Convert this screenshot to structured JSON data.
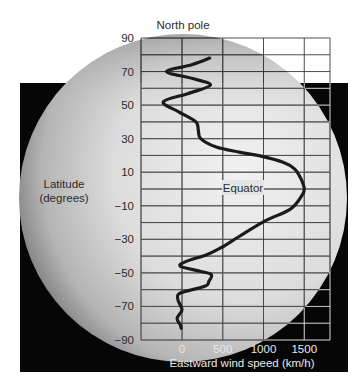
{
  "chart_data": {
    "type": "line",
    "title": "North pole",
    "xlabel": "Eastward wind speed (km/h)",
    "ylabel": "Latitude\n(degrees)",
    "annotation": "Equator",
    "xlim": [
      -200,
      1800
    ],
    "ylim": [
      -90,
      90
    ],
    "xticks": [
      0,
      500,
      1000,
      1500
    ],
    "yticks": [
      90,
      70,
      50,
      30,
      10,
      -10,
      -30,
      -50,
      -70,
      -90
    ],
    "grid": true,
    "legend": null,
    "series": [
      {
        "name": "Eastward wind speed profile",
        "points": [
          {
            "lat": 78,
            "speed": 340
          },
          {
            "lat": 74,
            "speed": 120
          },
          {
            "lat": 70,
            "speed": -190
          },
          {
            "lat": 66,
            "speed": 120
          },
          {
            "lat": 62,
            "speed": 350
          },
          {
            "lat": 57,
            "speed": 80
          },
          {
            "lat": 52,
            "speed": -230
          },
          {
            "lat": 46,
            "speed": -40
          },
          {
            "lat": 40,
            "speed": 170
          },
          {
            "lat": 35,
            "speed": 200
          },
          {
            "lat": 30,
            "speed": 230
          },
          {
            "lat": 25,
            "speed": 420
          },
          {
            "lat": 22,
            "speed": 700
          },
          {
            "lat": 20,
            "speed": 930
          },
          {
            "lat": 16,
            "speed": 1240
          },
          {
            "lat": 12,
            "speed": 1380
          },
          {
            "lat": 6,
            "speed": 1460
          },
          {
            "lat": 0,
            "speed": 1500
          },
          {
            "lat": -4,
            "speed": 1470
          },
          {
            "lat": -12,
            "speed": 1330
          },
          {
            "lat": -19,
            "speed": 1020
          },
          {
            "lat": -28,
            "speed": 710
          },
          {
            "lat": -35,
            "speed": 480
          },
          {
            "lat": -39,
            "speed": 310
          },
          {
            "lat": -43,
            "speed": 60
          },
          {
            "lat": -46,
            "speed": -20
          },
          {
            "lat": -49,
            "speed": 220
          },
          {
            "lat": -51,
            "speed": 360
          },
          {
            "lat": -55,
            "speed": 330
          },
          {
            "lat": -58,
            "speed": 280
          },
          {
            "lat": -62,
            "speed": -20
          },
          {
            "lat": -66,
            "speed": -50
          },
          {
            "lat": -72,
            "speed": 0
          },
          {
            "lat": -77,
            "speed": -60
          },
          {
            "lat": -81,
            "speed": -20
          },
          {
            "lat": -83,
            "speed": -10
          }
        ]
      }
    ]
  },
  "labels": {
    "north_pole": "North pole",
    "latitude_line1": "Latitude",
    "latitude_line2": "(degrees)",
    "equator": "Equator",
    "x_axis_title": "Eastward wind speed (km/h)"
  },
  "colors": {
    "background": "#ffffff",
    "space_backdrop": "#060606",
    "sphere_light": "#eeeeee",
    "sphere_dark": "#7a7a7a",
    "grid_line": "#3a3a3a",
    "grid_line_on_dark": "#d8d8d8",
    "curve": "#1a1a1a",
    "text_dark": "#2b2b2b",
    "text_light": "#e8e8e8"
  }
}
